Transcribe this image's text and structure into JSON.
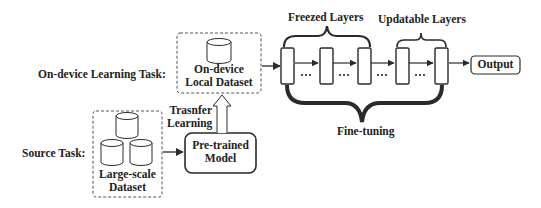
{
  "diagram": {
    "rows": {
      "target": {
        "label": "On-device Learning Task:"
      },
      "source": {
        "label": "Source Task:"
      }
    },
    "local_dataset": {
      "line1": "On-device",
      "line2": "Local Dataset",
      "icon": "database-cylinder-icon"
    },
    "large_dataset": {
      "line1": "Large-scale",
      "line2": "Dataset",
      "icon_count": 3
    },
    "pretrained_model": {
      "line1": "Pre-trained",
      "line2": "Model"
    },
    "transfer": {
      "line1": "Trasnfer",
      "line2": "Learning"
    },
    "network": {
      "layer_count": 5,
      "separator": "•••",
      "freezed_label": "Freezed Layers",
      "updatable_label": "Updatable Layers",
      "finetune_label": "Fine-tuning",
      "output_label": "Output"
    },
    "colors": {
      "stroke": "#2a2a2a",
      "dashed": "#555555",
      "background": "#ffffff"
    }
  }
}
